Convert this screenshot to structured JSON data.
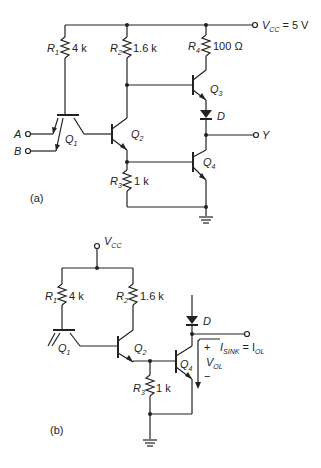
{
  "diagram": {
    "a": {
      "caption": "(a)",
      "supply": {
        "label": "V",
        "sub": "CC",
        "value": "= 5 V"
      },
      "resistors": [
        {
          "name": "R",
          "sub": "1",
          "value": "4 k"
        },
        {
          "name": "R",
          "sub": "2",
          "value": "1.6 k"
        },
        {
          "name": "R",
          "sub": "3",
          "value": "1 k"
        },
        {
          "name": "R",
          "sub": "4",
          "value": "100 Ω"
        }
      ],
      "transistors": [
        {
          "name": "Q",
          "sub": "1"
        },
        {
          "name": "Q",
          "sub": "2"
        },
        {
          "name": "Q",
          "sub": "3"
        },
        {
          "name": "Q",
          "sub": "4"
        }
      ],
      "diode": "D",
      "inputs": [
        "A",
        "B"
      ],
      "output": "Y"
    },
    "b": {
      "caption": "(b)",
      "supply": {
        "label": "V",
        "sub": "CC"
      },
      "resistors": [
        {
          "name": "R",
          "sub": "1",
          "value": "4 k"
        },
        {
          "name": "R",
          "sub": "2",
          "value": "1.6 k"
        },
        {
          "name": "R",
          "sub": "3",
          "value": "1 k"
        }
      ],
      "transistors": [
        {
          "name": "Q",
          "sub": "1"
        },
        {
          "name": "Q",
          "sub": "2"
        },
        {
          "name": "Q",
          "sub": "4"
        }
      ],
      "diode": "D",
      "current": {
        "label": "I",
        "sub": "SINK",
        "eq": "= I",
        "eq_sub": "OL",
        "plus": "+"
      },
      "voltage": {
        "label": "V",
        "sub": "OL",
        "minus": "−"
      }
    }
  }
}
